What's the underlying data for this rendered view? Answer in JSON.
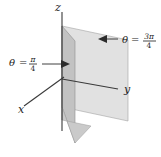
{
  "figure": {
    "background_color": "#ffffff",
    "axes": {
      "z_label": "z",
      "x_label": "x",
      "y_label": "y"
    },
    "annotations": [
      {
        "id": "left-plane-annotation",
        "theta_symbol": "θ",
        "equals": "=",
        "numerator": "π",
        "denominator": "4",
        "full_text": "θ = π/4",
        "arrow_direction": "right"
      },
      {
        "id": "right-plane-annotation",
        "theta_symbol": "θ",
        "equals": "=",
        "numerator": "3π",
        "denominator": "4",
        "full_text": "θ = 3π/4",
        "arrow_direction": "left"
      }
    ],
    "surfaces": [
      {
        "id": "near-plane",
        "label": "theta = pi/4 half-plane",
        "fill_color": "#c2c2c2",
        "edge_color": "#8d8d8d"
      },
      {
        "id": "far-plane",
        "label": "theta = 3pi/4 half-plane",
        "fill_color": "#e1e1e1",
        "edge_color": "#9a9a9a"
      }
    ],
    "colors": {
      "axis": "#3a3a3a",
      "leader": "#2b2b2b",
      "text": "#1a1a1a",
      "near_plane": "#c2c2c2",
      "far_plane": "#e1e1e1"
    }
  }
}
